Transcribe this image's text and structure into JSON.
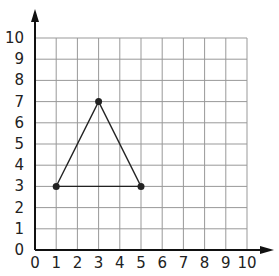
{
  "chart_data": {
    "type": "scatter",
    "title": "",
    "xlabel": "",
    "ylabel": "",
    "xlim": [
      0,
      10
    ],
    "ylim": [
      0,
      10
    ],
    "grid": true,
    "x_ticks": [
      "0",
      "1",
      "2",
      "3",
      "4",
      "5",
      "6",
      "7",
      "8",
      "9",
      "10"
    ],
    "y_ticks": [
      "0",
      "1",
      "2",
      "3",
      "4",
      "5",
      "6",
      "7",
      "8",
      "9",
      "10"
    ],
    "points": [
      {
        "x": 1,
        "y": 3
      },
      {
        "x": 3,
        "y": 7
      },
      {
        "x": 5,
        "y": 3
      }
    ],
    "shape": "triangle",
    "segments": [
      {
        "from": [
          1,
          3
        ],
        "to": [
          3,
          7
        ]
      },
      {
        "from": [
          3,
          7
        ],
        "to": [
          5,
          3
        ]
      },
      {
        "from": [
          1,
          3
        ],
        "to": [
          5,
          3
        ]
      }
    ],
    "colors": {
      "grid": "#999999",
      "axis": "#111111",
      "shape": "#222222"
    }
  }
}
